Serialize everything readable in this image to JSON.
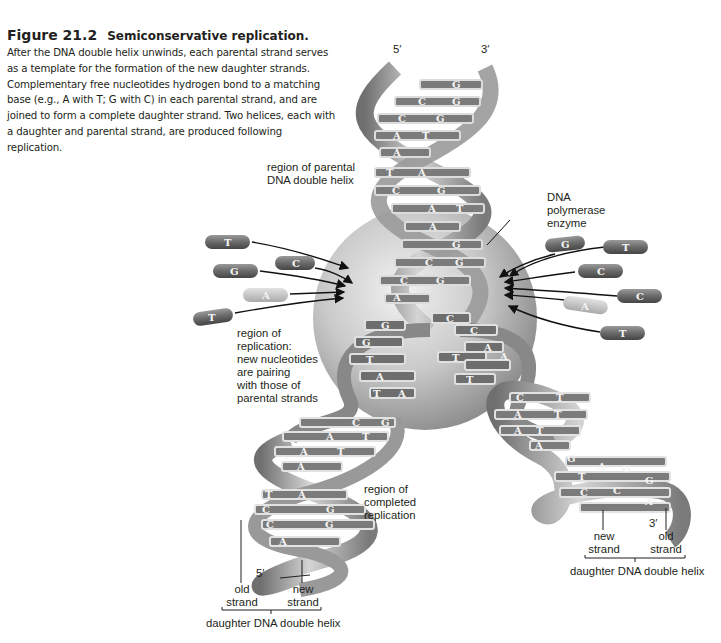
{
  "figure": {
    "number": "Figure 21.2",
    "title": "Semiconservative replication.",
    "caption": "After the DNA double helix unwinds, each parental strand serves as a template for the formation of the new daughter strands. Complementary free nucleotides hydrogen bond to a matching base (e.g., A with T; G with C) in each parental strand, and are joined to form a complete daughter strand. Two helices, each with a daughter and parental strand, are produced following replication."
  },
  "labels": {
    "top_5prime": "5′",
    "top_3prime": "3′",
    "parental_region": "region of parental\nDNA double helix",
    "polymerase": "DNA\npolymerase\nenzyme",
    "replication_region": "region of\nreplication:\nnew nucleotides\nare pairing\nwith those of\nparental strands",
    "completed_region": "region of\ncompleted\nreplication",
    "left_5prime": "5′",
    "left_old_strand": "old\nstrand",
    "left_new_strand": "new\nstrand",
    "left_daughter": "daughter DNA double helix",
    "right_3prime": "3′",
    "right_new_strand": "new\nstrand",
    "right_old_strand": "old\nstrand",
    "right_daughter": "daughter DNA double helix"
  },
  "free_nucleotides": {
    "left": [
      "T",
      "C",
      "G",
      "A",
      "T"
    ],
    "right": [
      "G",
      "T",
      "C",
      "C",
      "A",
      "T"
    ]
  },
  "base_pairs": {
    "parental_top": [
      [
        "",
        "G"
      ],
      [
        "C",
        "G"
      ],
      [
        "C",
        "G"
      ],
      [
        "A",
        "T"
      ],
      [
        "A",
        ""
      ]
    ],
    "parental_mid": [
      [
        "T",
        "A"
      ],
      [
        "C",
        "G"
      ],
      [
        "A",
        "T"
      ],
      [
        "A",
        ""
      ]
    ],
    "in_enzyme": [
      [
        "",
        "G"
      ],
      [
        "C",
        "G"
      ],
      [
        "C",
        "G"
      ],
      [
        "A",
        ""
      ]
    ],
    "left_fork": [
      "G",
      "G",
      "T",
      "A",
      "T",
      "A"
    ],
    "right_fork": [
      "C",
      "C",
      "A",
      "T",
      "T",
      "A"
    ],
    "left_daughter": [
      [
        "C",
        "G"
      ],
      [
        "A",
        "T"
      ],
      [
        "A",
        "T"
      ],
      [
        "A",
        ""
      ],
      [
        "T",
        "A"
      ],
      [
        "C",
        "G"
      ],
      [
        "C",
        "G"
      ],
      [
        "A",
        ""
      ]
    ],
    "right_daughter": [
      [
        "C",
        "T"
      ],
      [
        "A",
        "T"
      ],
      [
        "A",
        "T"
      ],
      [
        "A",
        ""
      ],
      [
        "G",
        ""
      ],
      [
        "T",
        "A"
      ],
      [
        "C",
        "G"
      ],
      [
        "C",
        "G"
      ],
      [
        "A",
        ""
      ]
    ]
  },
  "colors": {
    "background": "#ffffff",
    "text": "#231f20",
    "strand": "#8c8c8c",
    "enzyme": "#b8b8b8",
    "nucleotide": "#6e6e6e",
    "nucleotide_light": "#c4c4c4"
  }
}
